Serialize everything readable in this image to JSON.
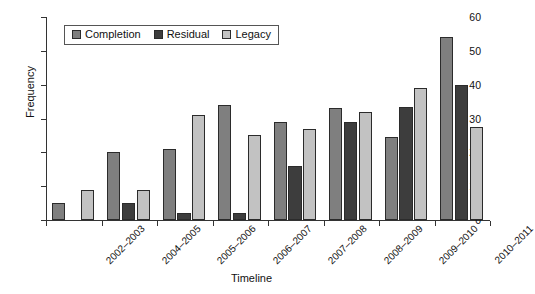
{
  "chart_data": {
    "type": "bar",
    "title": "",
    "xlabel": "Timeline",
    "ylabel": "Frequency",
    "ylim": [
      0,
      60
    ],
    "ytick_step": 10,
    "yticks": [
      0,
      10,
      20,
      30,
      40,
      50,
      60
    ],
    "grid": false,
    "legend_position": "top-left-inside",
    "categories": [
      "2002–2003",
      "2004–2005",
      "2005–2006",
      "2006–2007",
      "2007–2008",
      "2008–2009",
      "2009–2010",
      "2010–2011"
    ],
    "series": [
      {
        "name": "Completion",
        "color": "#7f7f7f",
        "values": [
          5,
          20,
          21,
          34,
          29,
          33,
          24.5,
          54
        ]
      },
      {
        "name": "Residual",
        "color": "#3d3d3d",
        "values": [
          0,
          5,
          2,
          2,
          16,
          29,
          33.5,
          40
        ]
      },
      {
        "name": "Legacy",
        "color": "#c2c2c2",
        "values": [
          9,
          9,
          31,
          25,
          27,
          32,
          39,
          27.5
        ]
      }
    ]
  },
  "axes": {
    "y_title": "Frequency",
    "x_title": "Timeline"
  },
  "legend": {
    "items": [
      {
        "label": "Completion",
        "swatch": "legend-swatch-completion"
      },
      {
        "label": "Residual",
        "swatch": "legend-swatch-residual"
      },
      {
        "label": "Legacy",
        "swatch": "legend-swatch-legacy"
      }
    ]
  }
}
